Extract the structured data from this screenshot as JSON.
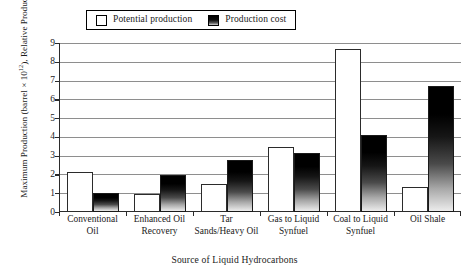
{
  "chart_data": {
    "type": "bar",
    "title": "",
    "xlabel": "Source of Liquid Hydrocarbons",
    "ylabel": "Maximum Production (barrel × 10¹²), Relative Production Cost",
    "ylabel_line1": "Maximum Production (barrel × 10",
    "ylabel_exponent": "12",
    "ylabel_line1_tail": "),",
    "ylabel_line2": "Relative Production Cost",
    "ylim": [
      0,
      9
    ],
    "ytick_step": 1,
    "yticks": [
      "0",
      "1",
      "2",
      "3",
      "4",
      "5",
      "6",
      "7",
      "8",
      "9"
    ],
    "grid": true,
    "grid_axis": "y",
    "legend_position": "top-center",
    "categories": [
      "Conventional Oil",
      "Enhanced Oil Recovery",
      "Tar Sands/Heavy Oil",
      "Gas to Liquid Synfuel",
      "Coal to Liquid Synfuel",
      "Oil Shale"
    ],
    "category_lines": [
      [
        "Conventional",
        "Oil"
      ],
      [
        "Enhanced Oil",
        "Recovery"
      ],
      [
        "Tar",
        "Sands/Heavy Oil"
      ],
      [
        "Gas to Liquid",
        "Synfuel"
      ],
      [
        "Coal to Liquid",
        "Synfuel"
      ],
      [
        "Oil Shale",
        ""
      ]
    ],
    "series": [
      {
        "name": "Potential production",
        "style": "white-outlined",
        "color": "#ffffff",
        "values": [
          2.15,
          0.95,
          1.48,
          3.45,
          8.7,
          1.35
        ]
      },
      {
        "name": "Production cost",
        "style": "black-to-white-gradient",
        "color": "#000000",
        "values": [
          1.0,
          1.97,
          2.75,
          3.12,
          4.1,
          6.7
        ]
      }
    ]
  },
  "legend": {
    "entries": [
      {
        "label": "Potential production",
        "swatch": "solid-white"
      },
      {
        "label": "Production cost",
        "swatch": "gradient"
      }
    ]
  },
  "colors": {
    "axis": "#2b2b2b",
    "grid": "#8e8e8e",
    "bar_potential": "#ffffff",
    "bar_cost_top": "#000000",
    "bar_cost_bottom": "#ececec",
    "background": "#ffffff",
    "text": "#1a1a1a"
  }
}
